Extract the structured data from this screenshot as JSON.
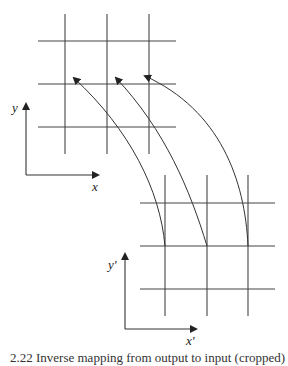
{
  "diagram": {
    "type": "coordinate-mapping",
    "source_frame": {
      "x_label": "x",
      "y_label": "y",
      "grid": {
        "cols": 3,
        "rows": 3
      }
    },
    "target_frame": {
      "x_label": "x'",
      "y_label": "y'",
      "grid": {
        "cols": 3,
        "rows": 3
      }
    },
    "arrows": [
      {
        "from": "target grid node (col 1, row 2)",
        "to": "source grid node (col 1, row 2)"
      },
      {
        "from": "target grid node (col 2, row 2)",
        "to": "source grid node (col 2, row 2)"
      },
      {
        "from": "target grid node (col 3, row 2)",
        "to": "source grid node (col 3, row 2)"
      }
    ],
    "colors": {
      "line": "#333333",
      "background": "#ffffff"
    }
  },
  "caption": "2.22  Inverse mapping from output to input (cropped)"
}
